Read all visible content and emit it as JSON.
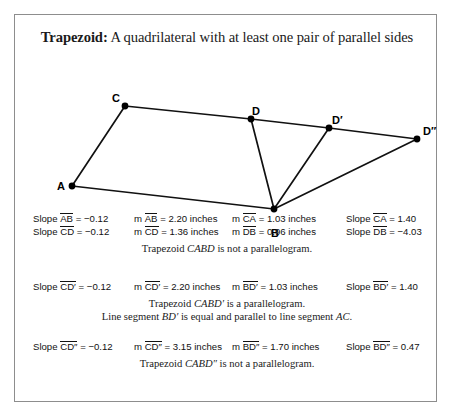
{
  "card": {
    "title_term": "Trapezoid:",
    "title_definition": " A quadrilateral with at least one pair of parallel sides",
    "border_color": "#8d8d8d",
    "background_color": "#ffffff"
  },
  "figure": {
    "stroke_color": "#111111",
    "point_color": "#000000",
    "vertices": [
      {
        "label": "A",
        "x": 57,
        "y": 171
      },
      {
        "label": "B",
        "x": 259,
        "y": 194
      },
      {
        "label": "C",
        "x": 110,
        "y": 91
      },
      {
        "label": "D",
        "x": 236,
        "y": 104
      },
      {
        "label": "D′",
        "x": 314,
        "y": 113
      },
      {
        "label": "D″",
        "x": 402,
        "y": 124
      }
    ],
    "edges": [
      [
        "A",
        "C"
      ],
      [
        "C",
        "D"
      ],
      [
        "D",
        "D′"
      ],
      [
        "D′",
        "D″"
      ],
      [
        "A",
        "B"
      ],
      [
        "B",
        "D"
      ],
      [
        "B",
        "D′"
      ],
      [
        "B",
        "D″"
      ]
    ]
  },
  "blocks": [
    {
      "rows": [
        [
          {
            "prefix": "Slope ",
            "segment": "AB",
            "suffix": " = −0.12"
          },
          {
            "prefix": "m ",
            "segment": "AB",
            "suffix": " = 2.20 inches"
          },
          {
            "prefix": "m ",
            "segment": "CA",
            "suffix": " = 1.03 inches"
          },
          {
            "prefix": "Slope ",
            "segment": "CA",
            "suffix": " = 1.40"
          }
        ],
        [
          {
            "prefix": "Slope ",
            "segment": "CD",
            "suffix": " = −0.12"
          },
          {
            "prefix": "m ",
            "segment": "CD",
            "suffix": " = 1.36 inches"
          },
          {
            "prefix": "m ",
            "segment": "DB",
            "suffix": " = 0.96 inches"
          },
          {
            "prefix": "Slope ",
            "segment": "DB",
            "suffix": " = −4.03"
          }
        ]
      ],
      "notes": [
        {
          "pre": "Trapezoid ",
          "em": "CABD",
          "post": " is not a parallelogram."
        }
      ]
    },
    {
      "rows": [
        [
          {
            "prefix": "Slope ",
            "segment": "CD′",
            "suffix": " = −0.12"
          },
          {
            "prefix": "m ",
            "segment": "CD′",
            "suffix": " = 2.20 inches"
          },
          {
            "prefix": "m ",
            "segment": "BD′",
            "suffix": " = 1.03 inches"
          },
          {
            "prefix": "Slope ",
            "segment": "BD′",
            "suffix": " = 1.40"
          }
        ]
      ],
      "notes": [
        {
          "pre": "Trapezoid ",
          "em": "CABD′",
          "post": " is a parallelogram."
        },
        {
          "pre": "Line segment ",
          "em": "BD′",
          "post": " is equal and parallel to line segment ",
          "em2": "AC",
          "post2": "."
        }
      ]
    },
    {
      "rows": [
        [
          {
            "prefix": "Slope ",
            "segment": "CD″",
            "suffix": " = −0.12"
          },
          {
            "prefix": "m ",
            "segment": "CD″",
            "suffix": " = 3.15 inches"
          },
          {
            "prefix": "m ",
            "segment": "BD″",
            "suffix": " = 1.70 inches"
          },
          {
            "prefix": "Slope ",
            "segment": "BD″",
            "suffix": " = 0.47"
          }
        ]
      ],
      "notes": [
        {
          "pre": "Trapezoid ",
          "em": "CABD″",
          "post": " is not a parallelogram."
        }
      ]
    }
  ]
}
